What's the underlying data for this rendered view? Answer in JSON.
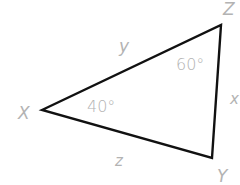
{
  "diagram": {
    "type": "triangle",
    "vertices": [
      {
        "id": "X",
        "label": "X",
        "x": 42,
        "y": 110
      },
      {
        "id": "Z",
        "label": "Z",
        "x": 221,
        "y": 25
      },
      {
        "id": "Y",
        "label": "Y",
        "x": 212,
        "y": 158
      }
    ],
    "sides": [
      {
        "id": "y",
        "label": "y",
        "from": "X",
        "to": "Z"
      },
      {
        "id": "x",
        "label": "x",
        "from": "Z",
        "to": "Y"
      },
      {
        "id": "z",
        "label": "z",
        "from": "X",
        "to": "Y"
      }
    ],
    "angles": [
      {
        "vertex": "X",
        "label": "40°"
      },
      {
        "vertex": "Z",
        "label": "60°"
      }
    ],
    "colors": {
      "stroke": "#111111",
      "label": "#b3b3b3"
    }
  }
}
